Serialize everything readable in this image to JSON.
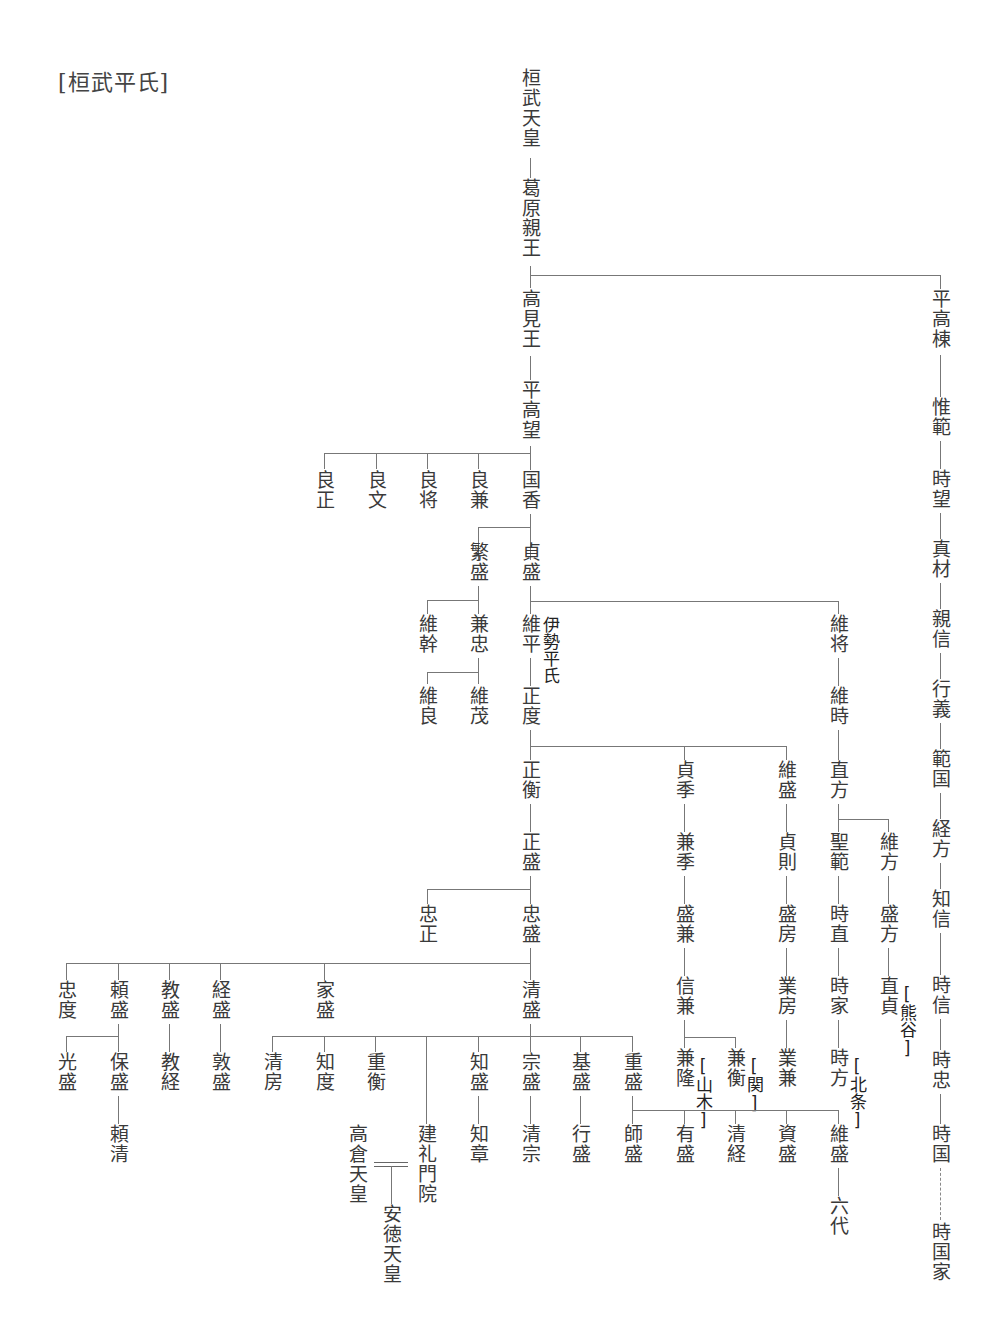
{
  "title": "[桓武平氏]",
  "nodes": {
    "kanmu": "桓武天皇",
    "kazurahara": "葛原親王",
    "takami": "高見王",
    "takamochi": "平高望",
    "yoshimasa": "良正",
    "yoshifumi": "良文",
    "yoshimasa2": "良将",
    "yoshikane": "良兼",
    "kunika": "国香",
    "shigemori0": "繁盛",
    "sadamori": "貞盛",
    "koremoto": "維幹",
    "kanetada": "兼忠",
    "koreyoshi": "維良",
    "koreshige": "維茂",
    "korehira": "維平",
    "masanori": "正度",
    "koremasa": "維将",
    "koretoki": "維時",
    "masahira": "正衡",
    "masamori": "正盛",
    "tadamasa": "忠正",
    "tadamori": "忠盛",
    "sadasue": "貞季",
    "kanesue": "兼季",
    "morikane": "盛兼",
    "nobukane": "信兼",
    "kanetaka": "兼隆",
    "kanehira": "兼衡",
    "koremori0": "維盛",
    "sadanori": "貞則",
    "morifusa": "盛房",
    "narifusa": "業房",
    "narikane": "業兼",
    "naokata": "直方",
    "kiyonori": "聖範",
    "tokinao": "時直",
    "tokiie": "時家",
    "tokikata": "時方",
    "korekata": "維方",
    "morikata": "盛方",
    "naozane": "直貞",
    "tadanori": "忠度",
    "yorimori": "頼盛",
    "norimori": "教盛",
    "tsunemori": "経盛",
    "iemori": "家盛",
    "kiyomori": "清盛",
    "mitsumori": "光盛",
    "yasumori": "保盛",
    "yorikiyo": "頼清",
    "noritsune": "教経",
    "atsumori": "敦盛",
    "kiyofusa": "清房",
    "tomonori": "知度",
    "shigehira": "重衡",
    "tomomori": "知盛",
    "munemori": "宗盛",
    "motomori": "基盛",
    "shigemori": "重盛",
    "takakura": "高倉天皇",
    "kenreimonin": "建礼門院",
    "antoku": "安徳天皇",
    "tomoakira": "知章",
    "kiyomune": "清宗",
    "yukimori": "行盛",
    "moromori": "師盛",
    "arimori": "有盛",
    "kiyotsune": "清経",
    "sukemori": "資盛",
    "koremori": "維盛",
    "rokudai": "六代",
    "takamune": "平高棟",
    "korenori": "惟範",
    "tokimochi": "時望",
    "sanemoto": "真材",
    "chikanobu": "親信",
    "yukiyoshi": "行義",
    "norikuni": "範国",
    "tsunekata": "経方",
    "tomonobu": "知信",
    "tokinobu": "時信",
    "tokitada": "時忠",
    "tokikuni": "時国",
    "tokikunie": "時国家"
  },
  "tags": {
    "ise": "伊勢平氏",
    "yamaki": "[山木]",
    "seki": "[関]",
    "hojo": "[北条]",
    "kumagai": "[熊谷]"
  }
}
